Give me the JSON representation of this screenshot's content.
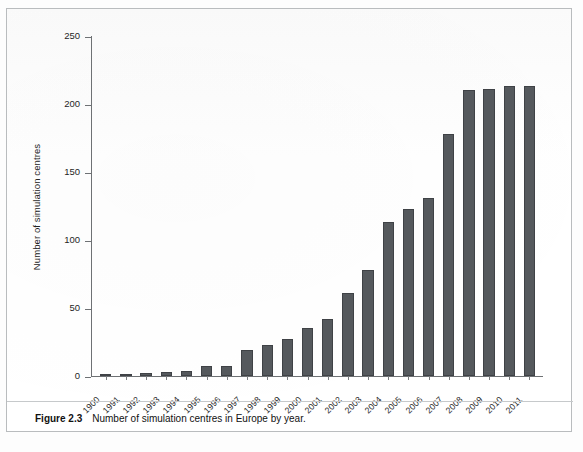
{
  "figure": {
    "number_label": "Figure 2.3",
    "caption_text": "Number of simulation centres in Europe by year."
  },
  "colors": {
    "bar_fill": "#55595d",
    "bar_stroke": "#3f4246",
    "axis": "#6e7174",
    "text": "#1f1f1f",
    "frame": "#b9bcbe"
  },
  "chart_data": {
    "type": "bar",
    "title": "",
    "subtitle": "",
    "xlabel": "",
    "ylabel": "Number of simulation centres",
    "ylim": [
      0,
      250
    ],
    "yticks": [
      0,
      50,
      100,
      150,
      200,
      250
    ],
    "ytick_labels": [
      "0",
      "50",
      "100",
      "150",
      "200",
      "250"
    ],
    "grid": false,
    "legend": null,
    "categories": [
      "1900",
      "1991",
      "1992",
      "1993",
      "1994",
      "1995",
      "1996",
      "1997",
      "1998",
      "1999",
      "2000",
      "2001",
      "2002",
      "2003",
      "2004",
      "2005",
      "2006",
      "2007",
      "2008",
      "2009",
      "2010",
      "2011"
    ],
    "values": [
      1,
      1,
      2,
      3,
      4,
      7,
      7,
      19,
      23,
      27,
      35,
      42,
      61,
      78,
      113,
      123,
      131,
      178,
      210,
      211,
      213,
      213
    ],
    "series": [
      {
        "name": "Number of simulation centres",
        "values": [
          1,
          1,
          2,
          3,
          4,
          7,
          7,
          19,
          23,
          27,
          35,
          42,
          61,
          78,
          113,
          123,
          131,
          178,
          210,
          211,
          213,
          213
        ]
      }
    ],
    "annotations": []
  }
}
